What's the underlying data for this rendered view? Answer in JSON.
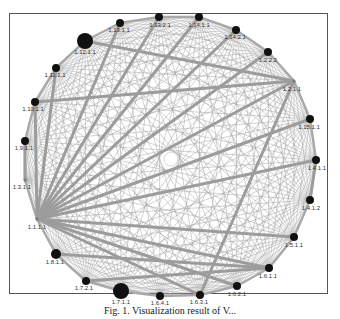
{
  "figure": {
    "caption": "Fig. 1. Visualization result of V...",
    "center": [
      171,
      159
    ],
    "radius": 138,
    "edge_color": "#9a9a9a",
    "node_color": "#111111"
  },
  "nodes": [
    {
      "id": "1.1.1.1",
      "x": 37,
      "y": 219,
      "r": 1.5,
      "lx": 37,
      "ly": 229
    },
    {
      "id": "1.3.1.1",
      "x": 25,
      "y": 180,
      "r": 1.5,
      "lx": 22,
      "ly": 189
    },
    {
      "id": "1.9.1.1",
      "x": 25,
      "y": 141,
      "r": 4,
      "lx": 24,
      "ly": 150
    },
    {
      "id": "1.10.1.1",
      "x": 35,
      "y": 102,
      "r": 4,
      "lx": 33,
      "ly": 111
    },
    {
      "id": "1.11.1.1",
      "x": 56,
      "y": 68,
      "r": 4,
      "lx": 55,
      "ly": 77
    },
    {
      "id": "1.12.1.1",
      "x": 85,
      "y": 41,
      "r": 8,
      "lx": 85,
      "ly": 54
    },
    {
      "id": "1.13.1.1",
      "x": 120,
      "y": 23,
      "r": 4,
      "lx": 119,
      "ly": 32
    },
    {
      "id": "1.13.2.1",
      "x": 159,
      "y": 17,
      "r": 4,
      "lx": 160,
      "ly": 27
    },
    {
      "id": "1.14.1.1",
      "x": 199,
      "y": 17,
      "r": 4,
      "lx": 199,
      "ly": 27
    },
    {
      "id": "1.14.2.1",
      "x": 236,
      "y": 30,
      "r": 4,
      "lx": 235,
      "ly": 39
    },
    {
      "id": "1.2.2.2",
      "x": 268,
      "y": 52,
      "r": 4,
      "lx": 268,
      "ly": 62
    },
    {
      "id": "1.2.1.1",
      "x": 294,
      "y": 81,
      "r": 1.5,
      "lx": 292,
      "ly": 91
    },
    {
      "id": "1.15.1.1",
      "x": 310,
      "y": 119,
      "r": 4,
      "lx": 309,
      "ly": 129
    },
    {
      "id": "1.4.1.1",
      "x": 316,
      "y": 160,
      "r": 4,
      "lx": 317,
      "ly": 170
    },
    {
      "id": "1.4.1.2",
      "x": 310,
      "y": 200,
      "r": 4,
      "lx": 311,
      "ly": 210
    },
    {
      "id": "1.5.1.1",
      "x": 294,
      "y": 237,
      "r": 4,
      "lx": 294,
      "ly": 247
    },
    {
      "id": "1.6.1.1",
      "x": 269,
      "y": 268,
      "r": 4,
      "lx": 268,
      "ly": 278
    },
    {
      "id": "1.6.2.1",
      "x": 237,
      "y": 286,
      "r": 4,
      "lx": 237,
      "ly": 296
    },
    {
      "id": "1.6.3.1",
      "x": 200,
      "y": 295,
      "r": 4,
      "lx": 199,
      "ly": 304
    },
    {
      "id": "1.6.4.1",
      "x": 160,
      "y": 296,
      "r": 4,
      "lx": 160,
      "ly": 305
    },
    {
      "id": "1.7.1.1",
      "x": 121,
      "y": 291,
      "r": 8,
      "lx": 121,
      "ly": 304
    },
    {
      "id": "1.7.2.1",
      "x": 86,
      "y": 281,
      "r": 4,
      "lx": 84,
      "ly": 290
    },
    {
      "id": "1.8.1.1",
      "x": 56,
      "y": 254,
      "r": 5,
      "lx": 55,
      "ly": 264
    }
  ],
  "thick_edges": [
    [
      "1.1.1.1",
      "1.2.1.1"
    ],
    [
      "1.1.1.1",
      "1.14.2.1"
    ],
    [
      "1.1.1.1",
      "1.13.2.1"
    ],
    [
      "1.1.1.1",
      "1.13.1.1"
    ],
    [
      "1.1.1.1",
      "1.15.1.1"
    ],
    [
      "1.1.1.1",
      "1.4.1.1"
    ],
    [
      "1.1.1.1",
      "1.5.1.1"
    ],
    [
      "1.1.1.1",
      "1.6.1.1"
    ],
    [
      "1.1.1.1",
      "1.6.2.1"
    ],
    [
      "1.1.1.1",
      "1.6.3.1"
    ],
    [
      "1.1.1.1",
      "1.10.1.1"
    ],
    [
      "1.1.1.1",
      "1.11.1.1"
    ],
    [
      "1.1.1.1",
      "1.2.2.2"
    ],
    [
      "1.1.1.1",
      "1.14.1.1"
    ],
    [
      "1.4.1.1",
      "1.4.1.2"
    ],
    [
      "1.3.1.1",
      "1.9.1.1"
    ],
    [
      "1.2.1.1",
      "1.12.1.1"
    ],
    [
      "1.2.1.1",
      "1.10.1.1"
    ],
    [
      "1.2.1.1",
      "1.6.3.1"
    ],
    [
      "1.6.1.1",
      "1.7.2.1"
    ],
    [
      "1.6.1.1",
      "1.8.1.1"
    ]
  ]
}
